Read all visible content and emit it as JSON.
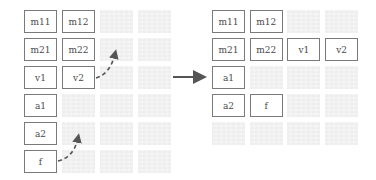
{
  "diagram": {
    "title": "",
    "colors": {
      "box_border": "#7a7a7a",
      "box_text": "#4a4a4a",
      "placeholder": "#f4f4f4",
      "arrow": "#555555"
    },
    "before": {
      "grid_cols": 4,
      "grid_rows": 6,
      "cells": [
        {
          "row": 0,
          "col": 0,
          "label": "m11"
        },
        {
          "row": 0,
          "col": 1,
          "label": "m12"
        },
        {
          "row": 1,
          "col": 0,
          "label": "m21"
        },
        {
          "row": 1,
          "col": 1,
          "label": "m22"
        },
        {
          "row": 2,
          "col": 0,
          "label": "v1"
        },
        {
          "row": 2,
          "col": 1,
          "label": "v2"
        },
        {
          "row": 3,
          "col": 0,
          "label": "a1"
        },
        {
          "row": 4,
          "col": 0,
          "label": "a2"
        },
        {
          "row": 5,
          "col": 0,
          "label": "f"
        }
      ]
    },
    "after": {
      "grid_cols": 4,
      "grid_rows": 5,
      "cells": [
        {
          "row": 0,
          "col": 0,
          "label": "m11"
        },
        {
          "row": 0,
          "col": 1,
          "label": "m12"
        },
        {
          "row": 1,
          "col": 0,
          "label": "m21"
        },
        {
          "row": 1,
          "col": 1,
          "label": "m22"
        },
        {
          "row": 1,
          "col": 2,
          "label": "v1"
        },
        {
          "row": 1,
          "col": 3,
          "label": "v2"
        },
        {
          "row": 2,
          "col": 0,
          "label": "a1"
        },
        {
          "row": 3,
          "col": 0,
          "label": "a2"
        },
        {
          "row": 3,
          "col": 1,
          "label": "f"
        }
      ]
    },
    "moves": [
      {
        "from": "v2",
        "description": "v2 moves up to row of m21/m22"
      },
      {
        "from": "f",
        "description": "f moves up beside a2"
      }
    ],
    "transition_arrow": "right-arrow"
  }
}
